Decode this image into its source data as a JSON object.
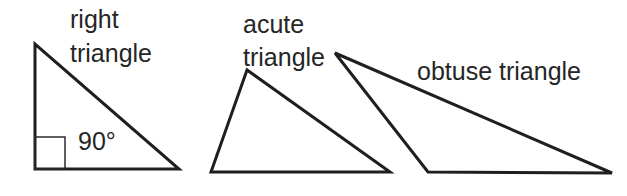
{
  "diagram": {
    "triangles": [
      {
        "name": "right",
        "label_lines": [
          "right",
          "triangle"
        ],
        "angle_label": "90°",
        "vertices": [
          [
            35,
            44
          ],
          [
            35,
            169
          ],
          [
            179,
            169
          ]
        ],
        "right_angle_marker": {
          "x": 35,
          "y": 137,
          "size": 30
        }
      },
      {
        "name": "acute",
        "label_lines": [
          "acute",
          "triangle"
        ],
        "vertices": [
          [
            247,
            70
          ],
          [
            211,
            172
          ],
          [
            390,
            172
          ]
        ]
      },
      {
        "name": "obtuse",
        "label_lines": [
          "obtuse triangle"
        ],
        "vertices": [
          [
            335,
            53
          ],
          [
            428,
            172
          ],
          [
            612,
            173
          ]
        ]
      }
    ],
    "stroke_color": "#1f1f1f",
    "text_color": "#262626"
  }
}
